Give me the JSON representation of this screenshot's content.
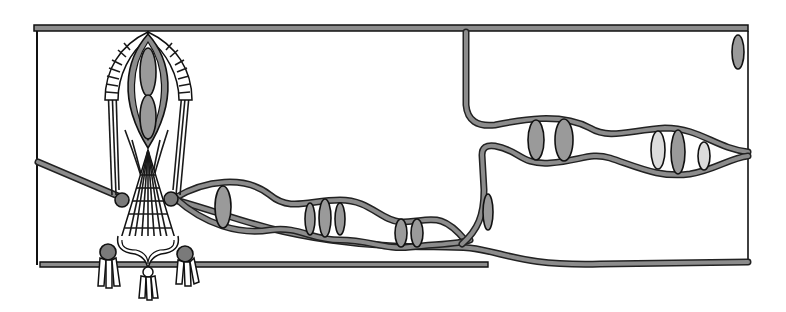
{
  "illustration": {
    "title": "",
    "description": "Hand-drawn monochrome frieze: a central bundled column ornament with tassels on the left, and wavy twin bands carrying lens-shaped inlays across a framed panel divided by a vertical band.",
    "colors": {
      "background": "#ffffff",
      "outline": "#111111",
      "band_fill": "#8c8c8c",
      "lens_dark": "#9a9a9a",
      "lens_light": "#dcdcdc",
      "knob": "#7a7a7a"
    },
    "frame": {
      "x": 36,
      "y": 27,
      "width": 712,
      "height": 240
    },
    "lenses_left_band": [
      {
        "cx": 223,
        "cy": 207,
        "rx": 8,
        "ry": 21,
        "tone": "dark"
      },
      {
        "cx": 310,
        "cy": 219,
        "rx": 5,
        "ry": 16,
        "tone": "dark"
      },
      {
        "cx": 325,
        "cy": 218,
        "rx": 6,
        "ry": 19,
        "tone": "dark"
      },
      {
        "cx": 340,
        "cy": 219,
        "rx": 5,
        "ry": 16,
        "tone": "dark"
      },
      {
        "cx": 401,
        "cy": 233,
        "rx": 6,
        "ry": 14,
        "tone": "dark"
      },
      {
        "cx": 417,
        "cy": 233,
        "rx": 6,
        "ry": 14,
        "tone": "dark"
      }
    ],
    "lenses_right_band": [
      {
        "cx": 536,
        "cy": 140,
        "rx": 8,
        "ry": 20,
        "tone": "dark"
      },
      {
        "cx": 564,
        "cy": 140,
        "rx": 9,
        "ry": 21,
        "tone": "dark"
      },
      {
        "cx": 658,
        "cy": 150,
        "rx": 7,
        "ry": 19,
        "tone": "light"
      },
      {
        "cx": 678,
        "cy": 152,
        "rx": 7,
        "ry": 22,
        "tone": "dark"
      },
      {
        "cx": 704,
        "cy": 156,
        "rx": 6,
        "ry": 14,
        "tone": "light"
      }
    ],
    "lens_vertical_band": {
      "cx": 488,
      "cy": 212,
      "rx": 5,
      "ry": 18,
      "tone": "dark"
    },
    "lens_corner": {
      "cx": 738,
      "cy": 52,
      "rx": 6,
      "ry": 17,
      "tone": "dark"
    }
  }
}
